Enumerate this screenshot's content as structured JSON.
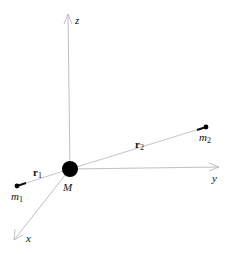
{
  "diagram": {
    "type": "3d-coordinate-vector-diagram",
    "origin": {
      "x": 70,
      "y": 170
    },
    "axes": [
      {
        "name": "z",
        "label": "z",
        "end": {
          "x": 68,
          "y": 14
        },
        "label_pos": {
          "x": 75,
          "y": 24
        }
      },
      {
        "name": "y",
        "label": "y",
        "end": {
          "x": 219,
          "y": 167
        },
        "label_pos": {
          "x": 212,
          "y": 182
        }
      },
      {
        "name": "x",
        "label": "x",
        "end": {
          "x": 14,
          "y": 240
        },
        "label_pos": {
          "x": 26,
          "y": 242
        }
      }
    ],
    "central_mass": {
      "label": "M",
      "center": {
        "x": 70,
        "y": 169
      },
      "radius": 8,
      "color": "#000000",
      "label_pos": {
        "x": 63,
        "y": 190
      }
    },
    "bodies": [
      {
        "name": "m1",
        "label_main": "m",
        "label_sub": "1",
        "position": {
          "x": 17,
          "y": 186
        },
        "label_pos": {
          "x": 11,
          "y": 200
        },
        "vector_label_main": "r",
        "vector_label_sub": "1",
        "vector_label_pos": {
          "x": 33,
          "y": 176
        }
      },
      {
        "name": "m2",
        "label_main": "m",
        "label_sub": "2",
        "position": {
          "x": 206,
          "y": 127
        },
        "label_pos": {
          "x": 199,
          "y": 141
        },
        "vector_label_main": "r",
        "vector_label_sub": "2",
        "vector_label_pos": {
          "x": 135,
          "y": 148
        }
      }
    ],
    "colors": {
      "axis": "#b8b8b8",
      "vector": "#bdbdbd",
      "mass": "#000000",
      "text": "#111111",
      "background": "#ffffff"
    }
  }
}
